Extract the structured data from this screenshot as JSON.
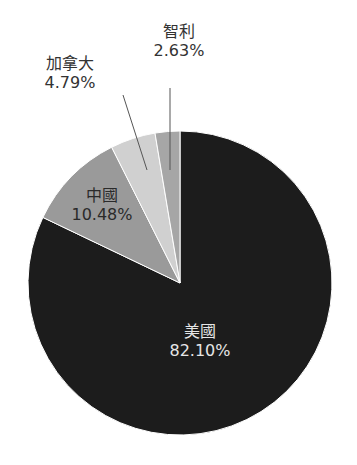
{
  "chart_data": {
    "type": "pie",
    "title": "",
    "start_angle_deg": 0,
    "direction": "clockwise",
    "slices": [
      {
        "label": "美國",
        "value": 82.1,
        "value_label": "82.10%",
        "color": "#1c1c1c"
      },
      {
        "label": "中國",
        "value": 10.48,
        "value_label": "10.48%",
        "color": "#9a9a9a"
      },
      {
        "label": "加拿大",
        "value": 4.79,
        "value_label": "4.79%",
        "color": "#d0d0d0"
      },
      {
        "label": "智利",
        "value": 2.63,
        "value_label": "2.63%",
        "color": "#a6a6a6"
      }
    ],
    "legend": "none",
    "label_style": "inside for large slices, outside with leader lines for small slices"
  },
  "labels": {
    "usa": {
      "name": "美國",
      "pct": "82.10%"
    },
    "china": {
      "name": "中國",
      "pct": "10.48%"
    },
    "canada": {
      "name": "加拿大",
      "pct": "4.79%"
    },
    "chile": {
      "name": "智利",
      "pct": "2.63%"
    }
  }
}
